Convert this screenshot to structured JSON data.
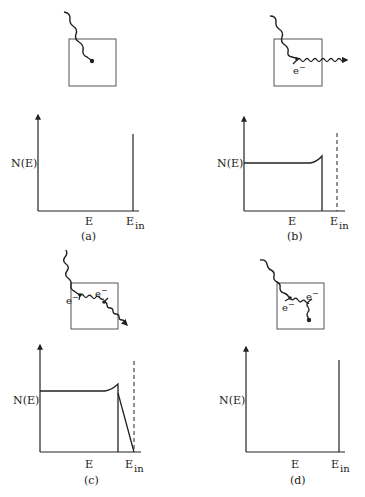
{
  "figure": {
    "panels": [
      {
        "id": "a",
        "caption": "(a)",
        "inset": {
          "electron_labels": []
        },
        "graph": {
          "ylabel": "N(E)",
          "xlabel": "E",
          "x_end_label_main": "E",
          "x_end_label_sub": "in",
          "spectrum": "single line at E_in"
        }
      },
      {
        "id": "b",
        "caption": "(b)",
        "inset": {
          "electron_labels": [
            {
              "base": "e",
              "sup": "−"
            }
          ]
        },
        "graph": {
          "ylabel": "N(E)",
          "xlabel": "E",
          "x_end_label_main": "E",
          "x_end_label_sub": "in",
          "spectrum": "Compton continuum with edge; dashed marker at E_in"
        }
      },
      {
        "id": "c",
        "caption": "(c)",
        "inset": {
          "electron_labels": [
            {
              "base": "e",
              "sup": "−"
            },
            {
              "base": "e",
              "sup": "−"
            }
          ]
        },
        "graph": {
          "ylabel": "N(E)",
          "xlabel": "E",
          "x_end_label_main": "E",
          "x_end_label_sub": "in",
          "spectrum": "Compton continuum plus multiple-Compton region up to E_in; dashed marker at E_in"
        }
      },
      {
        "id": "d",
        "caption": "(d)",
        "inset": {
          "electron_labels": [
            {
              "base": "e",
              "sup": "−"
            },
            {
              "base": "e",
              "sup": "−"
            }
          ]
        },
        "graph": {
          "ylabel": "N(E)",
          "xlabel": "E",
          "x_end_label_main": "E",
          "x_end_label_sub": "in",
          "spectrum": "single line at E_in"
        }
      }
    ]
  },
  "colors": {
    "ink": "#222222",
    "box": "#555555",
    "background": "#ffffff"
  }
}
